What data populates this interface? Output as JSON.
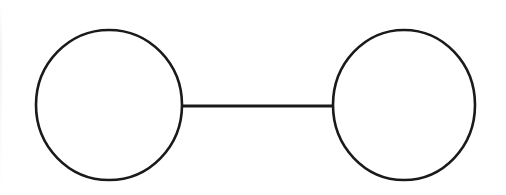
{
  "canvas": {
    "width": 506,
    "height": 195,
    "background_color": "#ffffff",
    "title": "Two-node graph diagram"
  },
  "style": {
    "stroke_color": "#1a1a1a",
    "node_stroke_width": 2.6,
    "edge_stroke_width": 3.0,
    "fill_color": "none"
  },
  "diagram_data": {
    "type": "graph",
    "description": "Two circles connected by a single horizontal straight line, forming a dumbbell or barbell shape",
    "node_count": 2,
    "edge_count": 1,
    "nodes": [
      {
        "id": "node-left",
        "shape": "circle",
        "cx": 109,
        "cy": 105,
        "rx": 73,
        "ry": 75,
        "label": ""
      },
      {
        "id": "node-right",
        "shape": "circle",
        "cx": 404,
        "cy": 105,
        "rx": 71,
        "ry": 75,
        "label": ""
      }
    ],
    "edges": [
      {
        "id": "edge-left-right",
        "from": "node-left",
        "to": "node-right",
        "x1": 182,
        "y1": 106,
        "x2": 334,
        "y2": 106,
        "label": ""
      }
    ]
  }
}
